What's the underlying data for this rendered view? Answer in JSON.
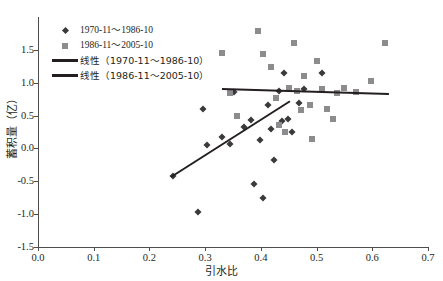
{
  "chart_data": {
    "type": "scatter",
    "title": "",
    "xlabel": "引水比",
    "ylabel": "蓄积量（亿）",
    "xlim": [
      0.0,
      0.7
    ],
    "ylim": [
      -1.5,
      2.0
    ],
    "xticks": [
      "0.0",
      "0.1",
      "0.2",
      "0.3",
      "0.4",
      "0.5",
      "0.6",
      "0.7"
    ],
    "xtick_values": [
      0.0,
      0.1,
      0.2,
      0.3,
      0.4,
      0.5,
      0.6,
      0.7
    ],
    "yticks": [
      "-1.5",
      "-1.0",
      "-0.5",
      "0.0",
      "0.5",
      "1.0",
      "1.5"
    ],
    "ytick_values": [
      -1.5,
      -1.0,
      -0.5,
      0.0,
      0.5,
      1.0,
      1.5
    ],
    "grid": false,
    "legend_position": "upper-left",
    "series": [
      {
        "name": "1970-11～1986-10",
        "marker": "diamond",
        "color": "#3a3a3c",
        "points": [
          [
            0.243,
            -0.415
          ],
          [
            0.287,
            -0.965
          ],
          [
            0.296,
            0.6
          ],
          [
            0.303,
            0.055
          ],
          [
            0.33,
            0.175
          ],
          [
            0.345,
            0.06
          ],
          [
            0.352,
            0.855
          ],
          [
            0.369,
            0.32
          ],
          [
            0.382,
            0.43
          ],
          [
            0.388,
            -0.545
          ],
          [
            0.399,
            0.125
          ],
          [
            0.404,
            -0.75
          ],
          [
            0.413,
            0.655
          ],
          [
            0.419,
            0.3
          ],
          [
            0.424,
            -0.18
          ],
          [
            0.432,
            0.875
          ],
          [
            0.438,
            0.42
          ],
          [
            0.441,
            1.15
          ],
          [
            0.448,
            0.445
          ],
          [
            0.455,
            0.255
          ],
          [
            0.469,
            0.69
          ],
          [
            0.478,
            0.905
          ],
          [
            0.509,
            1.145
          ]
        ]
      },
      {
        "name": "1986-11～2005-10",
        "marker": "square",
        "color": "#8c8c8e",
        "points": [
          [
            0.33,
            1.455
          ],
          [
            0.345,
            0.845
          ],
          [
            0.357,
            0.49
          ],
          [
            0.395,
            1.79
          ],
          [
            0.403,
            1.44
          ],
          [
            0.418,
            1.235
          ],
          [
            0.428,
            0.775
          ],
          [
            0.433,
            0.355
          ],
          [
            0.444,
            0.25
          ],
          [
            0.45,
            0.92
          ],
          [
            0.459,
            1.61
          ],
          [
            0.465,
            0.87
          ],
          [
            0.472,
            0.585
          ],
          [
            0.478,
            1.1
          ],
          [
            0.489,
            0.66
          ],
          [
            0.492,
            0.145
          ],
          [
            0.5,
            1.325
          ],
          [
            0.509,
            0.905
          ],
          [
            0.518,
            0.6
          ],
          [
            0.529,
            0.455
          ],
          [
            0.536,
            0.845
          ],
          [
            0.549,
            0.92
          ],
          [
            0.571,
            0.855
          ],
          [
            0.597,
            1.03
          ],
          [
            0.622,
            1.61
          ]
        ]
      }
    ],
    "trendlines": [
      {
        "name": "线性（1970-11～1986-10）",
        "color": "#231f20",
        "x0": 0.238,
        "y0": -0.42,
        "x1": 0.452,
        "y1": 0.735
      },
      {
        "name": "线性（1986-11～2005-10）",
        "color": "#231f20",
        "x0": 0.33,
        "y0": 0.92,
        "x1": 0.63,
        "y1": 0.845
      }
    ],
    "legend": [
      {
        "key": "diamond",
        "label": "1970-11～1986-10"
      },
      {
        "key": "square",
        "label": "1986-11～2005-10"
      },
      {
        "key": "line",
        "label": "线性（1970-11～1986-10）"
      },
      {
        "key": "line",
        "label": "线性（1986-11～2005-10）"
      }
    ]
  }
}
